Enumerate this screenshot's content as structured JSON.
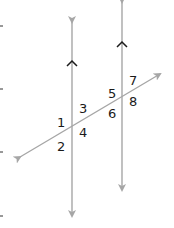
{
  "diagram": {
    "colors": {
      "line": "#a6a6a6",
      "parallel_mark": "#1a1a1a",
      "label": "#1a1a1a",
      "tick": "#333333"
    },
    "lines": [
      {
        "id": "parallel-line-left",
        "x1": 72,
        "y1": 22,
        "x2": 72,
        "y2": 216
      },
      {
        "id": "parallel-line-right",
        "x1": 122,
        "y1": 2,
        "x2": 122,
        "y2": 190
      },
      {
        "id": "transversal",
        "x1": 20,
        "y1": 157,
        "x2": 160,
        "y2": 74
      }
    ],
    "parallel_marks": [
      {
        "line": "parallel-line-left",
        "y": 62
      },
      {
        "line": "parallel-line-right",
        "y": 43
      }
    ],
    "angle_labels": [
      {
        "text": "1",
        "x": 57,
        "y": 127
      },
      {
        "text": "2",
        "x": 57,
        "y": 151
      },
      {
        "text": "3",
        "x": 79,
        "y": 113
      },
      {
        "text": "4",
        "x": 79,
        "y": 137
      },
      {
        "text": "5",
        "x": 108,
        "y": 98
      },
      {
        "text": "6",
        "x": 108,
        "y": 118
      },
      {
        "text": "7",
        "x": 129,
        "y": 85
      },
      {
        "text": "8",
        "x": 129,
        "y": 106
      }
    ],
    "edge_ticks": [
      26,
      89,
      152,
      216
    ]
  }
}
